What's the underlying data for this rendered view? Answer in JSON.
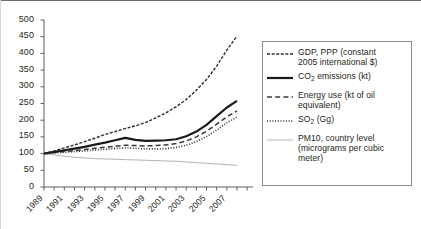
{
  "chart_data": {
    "type": "line",
    "title": "",
    "subtitle": "",
    "xlabel": "",
    "ylabel": "",
    "xlim": [
      1989,
      2008
    ],
    "ylim": [
      0,
      500
    ],
    "ytick_step": 50,
    "grid": false,
    "legend_position": "right",
    "note_index_base": "All series indexed to 100 in 1989",
    "x": [
      1989,
      1990,
      1991,
      1992,
      1993,
      1994,
      1995,
      1996,
      1997,
      1998,
      1999,
      2000,
      2001,
      2002,
      2003,
      2004,
      2005,
      2006,
      2007,
      2008
    ],
    "yticks": [
      0,
      50,
      100,
      150,
      200,
      250,
      300,
      350,
      400,
      450,
      500
    ],
    "ytick_labels": [
      "0",
      "50",
      "100",
      "150",
      "200",
      "250",
      "300",
      "350",
      "400",
      "450",
      "500"
    ],
    "xticks": [
      1989,
      1990,
      1991,
      1992,
      1993,
      1994,
      1995,
      1996,
      1997,
      1998,
      1999,
      2000,
      2001,
      2002,
      2003,
      2004,
      2005,
      2006,
      2007,
      2008
    ],
    "xtick_labels": [
      "1989",
      "1991",
      "1993",
      "1995",
      "1997",
      "1999",
      "2001",
      "2003",
      "2005",
      "2007"
    ],
    "xtick_labeled_years": [
      1989,
      1991,
      1993,
      1995,
      1997,
      1999,
      2001,
      2003,
      2005,
      2007
    ],
    "series": [
      {
        "name": "GDP, PPP (constant 2005 international $)",
        "legend_label_line1": "GDP, PPP (constant",
        "legend_label_line2": "2005 international $)",
        "style": "dashed-fine",
        "color": "#2b2b2b",
        "width": 1.4,
        "dasharray": "3,1.6",
        "values": [
          100,
          108,
          117,
          126,
          136,
          146,
          157,
          166,
          175,
          183,
          193,
          207,
          222,
          240,
          262,
          290,
          322,
          362,
          410,
          452
        ]
      },
      {
        "name": "CO2 emissions (kt)",
        "legend_label_line1": "CO",
        "legend_label_sub": "2",
        "legend_label_line1b": " emissions (kt)",
        "style": "solid-bold",
        "color": "#1a1a1a",
        "width": 2.2,
        "dasharray": "",
        "values": [
          100,
          105,
          110,
          115,
          120,
          127,
          133,
          140,
          147,
          141,
          138,
          139,
          140,
          143,
          152,
          166,
          186,
          212,
          238,
          258
        ]
      },
      {
        "name": "Energy use (kt of oil equivalent)",
        "legend_label_line1": "Energy use (kt of oil",
        "legend_label_line2": "equivalent)",
        "style": "dashed-long",
        "color": "#3a3a3a",
        "width": 1.5,
        "dasharray": "5,3",
        "values": [
          100,
          103,
          106,
          109,
          112,
          116,
          119,
          122,
          125,
          124,
          123,
          124,
          126,
          130,
          138,
          150,
          167,
          188,
          210,
          228
        ]
      },
      {
        "name": "SO2 (Gg)",
        "legend_label_line1": "SO",
        "legend_label_sub": "2",
        "legend_label_line1b": " (Gg)",
        "style": "dotted",
        "color": "#2b2b2b",
        "width": 1.6,
        "dasharray": "1,1.7",
        "values": [
          100,
          102,
          104,
          106,
          108,
          111,
          113,
          115,
          117,
          116,
          114,
          114,
          115,
          118,
          125,
          136,
          151,
          170,
          192,
          210
        ]
      },
      {
        "name": "PM10, country level (micrograms per cubic meter)",
        "legend_label_line1": "PM10, country level",
        "legend_label_line2": "(micrograms per cubic",
        "legend_label_line3": "meter)",
        "style": "thin-light",
        "color": "#b3b3b3",
        "width": 1.0,
        "dasharray": "",
        "values": [
          100,
          96,
          92,
          89,
          87,
          85,
          84,
          83,
          82,
          81,
          80,
          79,
          78,
          77,
          75,
          73,
          71,
          69,
          67,
          65
        ]
      }
    ]
  },
  "legend": {
    "entries": [
      {
        "id": "gdp",
        "swatch": "dashed-fine-swatch",
        "lines": [
          "GDP, PPP (constant",
          "2005 international $)"
        ]
      },
      {
        "id": "co2",
        "swatch": "solid-bold-swatch",
        "lines": [
          "CO₂ emissions (kt)"
        ]
      },
      {
        "id": "energy",
        "swatch": "dashed-long-swatch",
        "lines": [
          "Energy use (kt of oil",
          "equivalent)"
        ]
      },
      {
        "id": "so2",
        "swatch": "dotted-swatch",
        "lines": [
          "SO₂ (Gg)"
        ]
      },
      {
        "id": "pm10",
        "swatch": "thin-light-swatch",
        "lines": [
          "PM10, country level",
          "(micrograms per cubic",
          "meter)"
        ]
      }
    ]
  },
  "axis": {
    "y_labels": [
      "500",
      "450",
      "400",
      "350",
      "300",
      "250",
      "200",
      "150",
      "100",
      "50",
      "0"
    ],
    "x_labels": [
      "1989",
      "1991",
      "1993",
      "1995",
      "1997",
      "1999",
      "2001",
      "2003",
      "2005",
      "2007"
    ]
  },
  "colors": {
    "axis": "#4d4d4d",
    "text": "#231f20",
    "legend_border": "#8b8b8b",
    "gdp": "#2b2b2b",
    "co2": "#1a1a1a",
    "energy": "#3a3a3a",
    "so2": "#2b2b2b",
    "pm10": "#b3b3b3"
  }
}
